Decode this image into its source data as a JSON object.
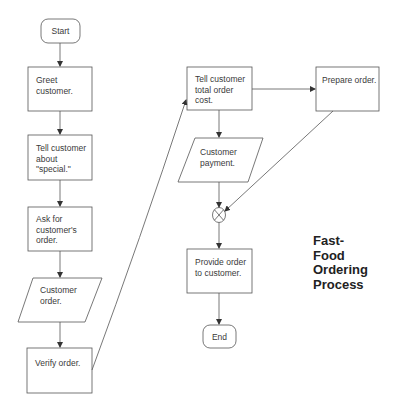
{
  "title": {
    "lines": [
      "Fast-",
      "Food",
      "Ordering",
      "Process"
    ]
  },
  "nodes": {
    "start": {
      "shape": "terminator",
      "label": "Start"
    },
    "greet": {
      "shape": "process",
      "label": "Greet customer."
    },
    "tell_special": {
      "shape": "process",
      "label": "Tell customer about \"special.\""
    },
    "ask_order": {
      "shape": "process",
      "label": "Ask for customer's order."
    },
    "customer_order": {
      "shape": "data",
      "label": "Customer order."
    },
    "verify": {
      "shape": "process",
      "label": "Verify order."
    },
    "tell_total": {
      "shape": "process",
      "label": "Tell customer total order cost."
    },
    "prepare": {
      "shape": "process",
      "label": "Prepare order."
    },
    "payment": {
      "shape": "data",
      "label": "Customer payment."
    },
    "join": {
      "shape": "summing-junction",
      "label": ""
    },
    "provide": {
      "shape": "process",
      "label": "Provide order to customer."
    },
    "end": {
      "shape": "terminator",
      "label": "End"
    }
  },
  "edges": [
    [
      "start",
      "greet"
    ],
    [
      "greet",
      "tell_special"
    ],
    [
      "tell_special",
      "ask_order"
    ],
    [
      "ask_order",
      "customer_order"
    ],
    [
      "customer_order",
      "verify"
    ],
    [
      "verify",
      "tell_total"
    ],
    [
      "tell_total",
      "prepare"
    ],
    [
      "tell_total",
      "payment"
    ],
    [
      "payment",
      "join"
    ],
    [
      "prepare",
      "join"
    ],
    [
      "join",
      "provide"
    ],
    [
      "provide",
      "end"
    ]
  ],
  "colors": {
    "stroke": "#555555",
    "text": "#3a3a3a",
    "background": "#ffffff"
  }
}
